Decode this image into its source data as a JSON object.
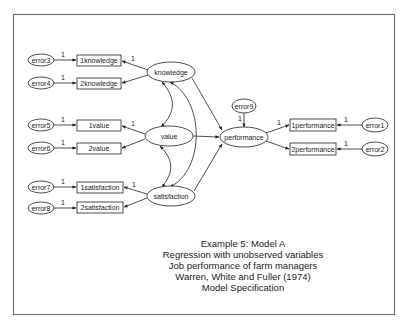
{
  "diagram": {
    "type": "structural-equation-model",
    "frame": {
      "border_color": "#777777"
    },
    "latent_variables": [
      {
        "id": "knowledge",
        "label": "knowledge"
      },
      {
        "id": "value",
        "label": "value"
      },
      {
        "id": "satisfaction",
        "label": "satisfaction"
      },
      {
        "id": "performance",
        "label": "performance"
      }
    ],
    "observed_variables": [
      {
        "id": "1knowledge",
        "label": "1knowledge"
      },
      {
        "id": "2knowledge",
        "label": "2knowledge"
      },
      {
        "id": "1value",
        "label": "1value"
      },
      {
        "id": "2value",
        "label": "2value"
      },
      {
        "id": "1satisfaction",
        "label": "1satisfaction"
      },
      {
        "id": "2satisfaction",
        "label": "2satisfaction"
      },
      {
        "id": "1performance",
        "label": "1performance"
      },
      {
        "id": "2performance",
        "label": "2performance"
      }
    ],
    "error_terms": [
      {
        "id": "error1",
        "label": "error1"
      },
      {
        "id": "error2",
        "label": "error2"
      },
      {
        "id": "error3",
        "label": "error3"
      },
      {
        "id": "error4",
        "label": "error4"
      },
      {
        "id": "error5",
        "label": "error5"
      },
      {
        "id": "error6",
        "label": "error6"
      },
      {
        "id": "error7",
        "label": "error7"
      },
      {
        "id": "error8",
        "label": "error8"
      },
      {
        "id": "error9",
        "label": "error9"
      }
    ],
    "fixed_path_label": "1",
    "edges": [
      {
        "from": "error3",
        "to": "1knowledge",
        "label": "1"
      },
      {
        "from": "error4",
        "to": "2knowledge",
        "label": "1"
      },
      {
        "from": "error5",
        "to": "1value",
        "label": "1"
      },
      {
        "from": "error6",
        "to": "2value",
        "label": "1"
      },
      {
        "from": "error7",
        "to": "1satisfaction",
        "label": "1"
      },
      {
        "from": "error8",
        "to": "2satisfaction",
        "label": "1"
      },
      {
        "from": "knowledge",
        "to": "1knowledge",
        "label": "1"
      },
      {
        "from": "knowledge",
        "to": "2knowledge",
        "label": ""
      },
      {
        "from": "value",
        "to": "1value",
        "label": "1"
      },
      {
        "from": "value",
        "to": "2value",
        "label": ""
      },
      {
        "from": "satisfaction",
        "to": "1satisfaction",
        "label": "1"
      },
      {
        "from": "satisfaction",
        "to": "2satisfaction",
        "label": ""
      },
      {
        "from": "knowledge",
        "to": "performance",
        "label": ""
      },
      {
        "from": "value",
        "to": "performance",
        "label": ""
      },
      {
        "from": "satisfaction",
        "to": "performance",
        "label": ""
      },
      {
        "from": "error9",
        "to": "performance",
        "label": "1"
      },
      {
        "from": "performance",
        "to": "1performance",
        "label": "1"
      },
      {
        "from": "performance",
        "to": "2performance",
        "label": ""
      },
      {
        "from": "error1",
        "to": "1performance",
        "label": "1"
      },
      {
        "from": "error2",
        "to": "2performance",
        "label": "1"
      }
    ],
    "covariances": [
      {
        "between": [
          "knowledge",
          "value"
        ]
      },
      {
        "between": [
          "value",
          "satisfaction"
        ]
      },
      {
        "between": [
          "knowledge",
          "satisfaction"
        ]
      }
    ],
    "caption": {
      "line1": "Example 5: Model A",
      "line2": "Regression with unobserved variables",
      "line3": "Job performance of farm managers",
      "line4": "Warren, White and Fuller (1974)",
      "line5": "Model Specification"
    }
  }
}
